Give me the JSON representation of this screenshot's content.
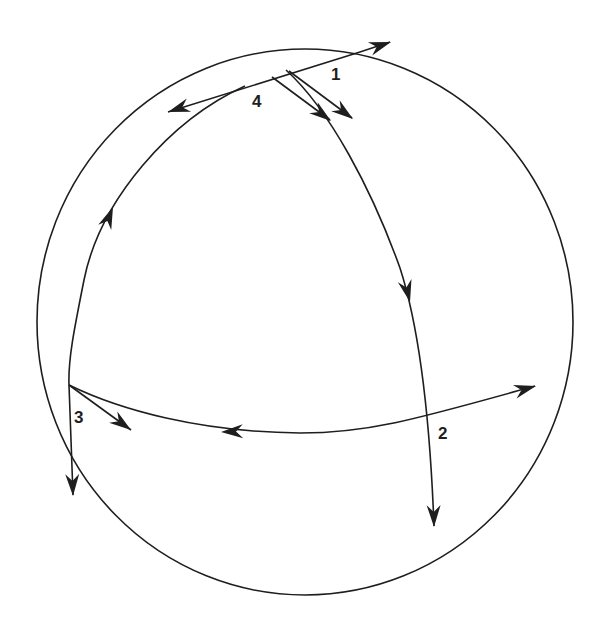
{
  "diagram": {
    "stroke_color": "#1e1e1e",
    "background_color": "#ffffff",
    "sphere": {
      "cx": 305,
      "cy": 322,
      "rx": 268,
      "ry": 273
    },
    "labels": [
      {
        "id": "1",
        "text": "1",
        "x": 331,
        "y": 66
      },
      {
        "id": "4",
        "text": "4",
        "x": 252,
        "y": 93
      },
      {
        "id": "3",
        "text": "3",
        "x": 74,
        "y": 409
      },
      {
        "id": "2",
        "text": "2",
        "x": 438,
        "y": 425
      }
    ],
    "paths": [
      {
        "name": "left-meridian",
        "d": "M 245 86 C 170 120, 100 200, 84 280 C 74 330, 68 360, 69 385 L 73 495"
      },
      {
        "name": "right-meridian",
        "d": "M 286 70 C 330 110, 372 190, 400 268 C 420 330, 430 420, 434 526"
      },
      {
        "name": "equator",
        "d": "M 69 385 C 120 410, 200 432, 300 433 C 370 433, 420 418, 535 386"
      },
      {
        "name": "top-tangent-line",
        "d": "M 168 112 L 360 52 L 390 42"
      },
      {
        "name": "tangent-vector-4",
        "d": "M 272 77 L 330 120"
      },
      {
        "name": "tangent-vector-1",
        "d": "M 289 71 L 352 118"
      },
      {
        "name": "tangent-vector-3",
        "d": "M 69 385 L 131 430"
      }
    ],
    "arrowheads": [
      {
        "name": "arrow-top-right",
        "tip": [
          391,
          42
        ],
        "angle": -18
      },
      {
        "name": "arrow-top-left",
        "tip": [
          168,
          112
        ],
        "angle": 162
      },
      {
        "name": "arrow-vector-4",
        "tip": [
          331,
          121
        ],
        "angle": 37
      },
      {
        "name": "arrow-vector-1",
        "tip": [
          353,
          119
        ],
        "angle": 37
      },
      {
        "name": "arrow-left-meridian-up",
        "tip": [
          113,
          207
        ],
        "angle": -68
      },
      {
        "name": "arrow-right-meridian-down",
        "tip": [
          410,
          302
        ],
        "angle": 76
      },
      {
        "name": "arrow-vector-3",
        "tip": [
          131,
          430
        ],
        "angle": 36
      },
      {
        "name": "arrow-left-meridian-down",
        "tip": [
          73,
          496
        ],
        "angle": 88
      },
      {
        "name": "arrow-equator-left",
        "tip": [
          221,
          432
        ],
        "angle": 178
      },
      {
        "name": "arrow-equator-right",
        "tip": [
          536,
          386
        ],
        "angle": -15
      },
      {
        "name": "arrow-right-meridian-bottom",
        "tip": [
          434,
          527
        ],
        "angle": 89
      }
    ]
  }
}
